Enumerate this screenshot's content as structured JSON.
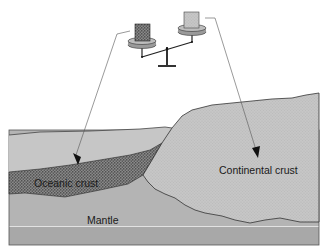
{
  "diagram": {
    "labels": {
      "oceanic_crust": "Oceanic crust",
      "continental_crust": "Continental crust",
      "mantle": "Mantle"
    },
    "balance": {
      "left_weight": "oceanic-crust-sample",
      "right_weight": "continental-crust-sample",
      "tilt": "left-pan-lower"
    },
    "colors": {
      "background": "#ffffff",
      "mantle_upper": "#b4b4b4",
      "mantle_lower": "#a9a9a9",
      "sea_layer": "#c3c3c3",
      "continental_crust": "#bcbcbc",
      "oceanic_crust": "#5a5a5a",
      "outline": "#3a3a3a"
    }
  }
}
